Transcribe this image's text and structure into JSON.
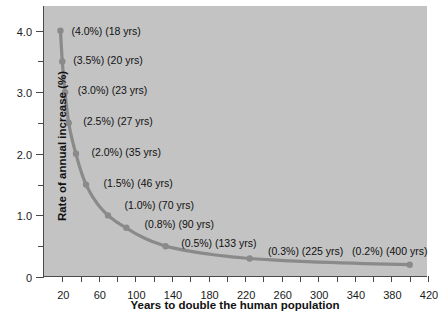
{
  "chart_data": {
    "type": "line",
    "title": "",
    "xlabel": "Years to double the human population",
    "ylabel": "Rate of annual increase (%)",
    "xlim": [
      0,
      420
    ],
    "ylim": [
      0,
      4.4
    ],
    "grid": false,
    "legend": "none",
    "x": [
      18,
      20,
      23,
      27,
      35,
      46,
      70,
      90,
      133,
      225,
      400
    ],
    "values": [
      4.0,
      3.5,
      3.0,
      2.5,
      2.0,
      1.5,
      1.0,
      0.8,
      0.5,
      0.3,
      0.2
    ],
    "series": [
      {
        "name": "Doubling time vs rate of annual increase",
        "x": [
          18,
          20,
          23,
          27,
          35,
          46,
          70,
          90,
          133,
          225,
          400
        ],
        "values": [
          4.0,
          3.5,
          3.0,
          2.5,
          2.0,
          1.5,
          1.0,
          0.8,
          0.5,
          0.3,
          0.2
        ]
      }
    ],
    "xticks": [
      20,
      60,
      100,
      140,
      180,
      220,
      260,
      300,
      340,
      380,
      420
    ],
    "xtick_labels": [
      "20",
      "60",
      "100",
      "140",
      "180",
      "220",
      "260",
      "300",
      "340",
      "380",
      "420"
    ],
    "xminor_step": 20,
    "yticks": [
      0,
      1.0,
      2.0,
      3.0,
      4.0
    ],
    "ytick_labels": [
      "0",
      "1.0",
      "2.0",
      "3.0",
      "4.0"
    ],
    "yminor_ticks": [
      0.5,
      1.5,
      2.5,
      3.5,
      4.0
    ],
    "annotations": [
      {
        "rate": "(4.0%)",
        "years": "(18 yrs)",
        "x": 18,
        "y": 4.0,
        "label_x": 30,
        "label_y": 4.0
      },
      {
        "rate": "(3.5%)",
        "years": "(20 yrs)",
        "x": 20,
        "y": 3.5,
        "label_x": 32,
        "label_y": 3.53
      },
      {
        "rate": "(3.0%)",
        "years": "(23 yrs)",
        "x": 23,
        "y": 3.0,
        "label_x": 37,
        "label_y": 3.04
      },
      {
        "rate": "(2.5%)",
        "years": "(27 yrs)",
        "x": 27,
        "y": 2.5,
        "label_x": 43,
        "label_y": 2.54
      },
      {
        "rate": "(2.0%)",
        "years": "(35 yrs)",
        "x": 35,
        "y": 2.0,
        "label_x": 52,
        "label_y": 2.03
      },
      {
        "rate": "(1.5%)",
        "years": "(46 yrs)",
        "x": 46,
        "y": 1.5,
        "label_x": 65,
        "label_y": 1.52
      },
      {
        "rate": "(1.0%)",
        "years": "(70 yrs)",
        "x": 70,
        "y": 1.0,
        "label_x": 88,
        "label_y": 1.17
      },
      {
        "rate": "(0.8%)",
        "years": "(90 yrs)",
        "x": 90,
        "y": 0.8,
        "label_x": 110,
        "label_y": 0.86
      },
      {
        "rate": "(0.5%)",
        "years": "(133 yrs)",
        "x": 133,
        "y": 0.5,
        "label_x": 150,
        "label_y": 0.56
      },
      {
        "rate": "(0.3%)",
        "years": "(225 yrs)",
        "x": 225,
        "y": 0.3,
        "label_x": 245,
        "label_y": 0.42
      },
      {
        "rate": "(0.2%)",
        "years": "(400 yrs)",
        "x": 400,
        "y": 0.2,
        "label_x": 337,
        "label_y": 0.42
      }
    ],
    "colors": {
      "plot_background": "#c3c3c3",
      "line": "#8a8a8a",
      "marker": "#8a8a8a",
      "axis": "#4a4a4a",
      "text": "#111111",
      "page_background": "#ffffff"
    }
  }
}
